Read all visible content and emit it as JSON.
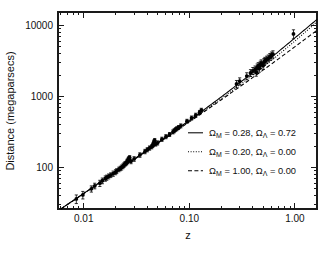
{
  "figure": {
    "background_color": "#ffffff",
    "ink_color": "#000000"
  },
  "axes": {
    "x_title": "z",
    "y_title": "Distance (megaparsecs)",
    "x_ticklabels": [
      "0.01",
      "0.10",
      "1.00"
    ],
    "y_ticklabels": [
      "100",
      "1000",
      "10000"
    ]
  },
  "legend": {
    "entries": [
      {
        "style": "solid",
        "text": "Ω_M = 0.28, Ω_Λ = 0.72",
        "om": "0.28",
        "ol": "0.72"
      },
      {
        "style": "dotted",
        "text": "Ω_M = 0.20, Ω_Λ = 0.00",
        "om": "0.20",
        "ol": "0.00"
      },
      {
        "style": "dashed",
        "text": "Ω_M = 1.00, Ω_Λ = 0.00",
        "om": "1.00",
        "ol": "0.00"
      }
    ],
    "omega_symbol": "Ω",
    "sub_m": "M",
    "sub_lambda": "Λ",
    "eq": " = ",
    "comma": ", "
  },
  "chart_data": {
    "type": "scatter",
    "title": "",
    "xlabel": "z",
    "ylabel": "Distance (megaparsecs)",
    "xscale": "log",
    "yscale": "log",
    "xlim": [
      0.0057,
      1.62
    ],
    "ylim": [
      26,
      15500
    ],
    "xticks": [
      0.01,
      0.1,
      1.0
    ],
    "yticks": [
      100,
      1000,
      10000
    ],
    "grid": false,
    "legend_position": "center-right",
    "marker": "filled-circle-with-vertical-errorbars",
    "points": [
      {
        "z": 0.0085,
        "d": 36,
        "err": 5
      },
      {
        "z": 0.0098,
        "d": 41,
        "err": 5
      },
      {
        "z": 0.0118,
        "d": 50,
        "err": 5
      },
      {
        "z": 0.0127,
        "d": 55,
        "err": 5
      },
      {
        "z": 0.0142,
        "d": 60,
        "err": 6
      },
      {
        "z": 0.015,
        "d": 65,
        "err": 6
      },
      {
        "z": 0.016,
        "d": 70,
        "err": 6
      },
      {
        "z": 0.0165,
        "d": 72,
        "err": 6
      },
      {
        "z": 0.0172,
        "d": 75,
        "err": 6
      },
      {
        "z": 0.018,
        "d": 78,
        "err": 6
      },
      {
        "z": 0.019,
        "d": 82,
        "err": 7
      },
      {
        "z": 0.02,
        "d": 86,
        "err": 7
      },
      {
        "z": 0.0205,
        "d": 89,
        "err": 7
      },
      {
        "z": 0.0215,
        "d": 94,
        "err": 7
      },
      {
        "z": 0.0222,
        "d": 97,
        "err": 7
      },
      {
        "z": 0.0228,
        "d": 100,
        "err": 8
      },
      {
        "z": 0.0235,
        "d": 104,
        "err": 8
      },
      {
        "z": 0.024,
        "d": 108,
        "err": 8
      },
      {
        "z": 0.0245,
        "d": 112,
        "err": 8
      },
      {
        "z": 0.025,
        "d": 114,
        "err": 8
      },
      {
        "z": 0.0255,
        "d": 118,
        "err": 9
      },
      {
        "z": 0.0258,
        "d": 122,
        "err": 9
      },
      {
        "z": 0.0262,
        "d": 126,
        "err": 9
      },
      {
        "z": 0.0265,
        "d": 130,
        "err": 9
      },
      {
        "z": 0.0268,
        "d": 134,
        "err": 9
      },
      {
        "z": 0.0272,
        "d": 138,
        "err": 9
      },
      {
        "z": 0.028,
        "d": 122,
        "err": 9
      },
      {
        "z": 0.03,
        "d": 132,
        "err": 10
      },
      {
        "z": 0.034,
        "d": 150,
        "err": 11
      },
      {
        "z": 0.038,
        "d": 168,
        "err": 12
      },
      {
        "z": 0.04,
        "d": 178,
        "err": 12
      },
      {
        "z": 0.042,
        "d": 188,
        "err": 13
      },
      {
        "z": 0.044,
        "d": 196,
        "err": 13
      },
      {
        "z": 0.045,
        "d": 205,
        "err": 14
      },
      {
        "z": 0.0455,
        "d": 212,
        "err": 14
      },
      {
        "z": 0.046,
        "d": 222,
        "err": 15
      },
      {
        "z": 0.0465,
        "d": 232,
        "err": 15
      },
      {
        "z": 0.047,
        "d": 240,
        "err": 16
      },
      {
        "z": 0.048,
        "d": 214,
        "err": 14
      },
      {
        "z": 0.05,
        "d": 222,
        "err": 15
      },
      {
        "z": 0.055,
        "d": 250,
        "err": 17
      },
      {
        "z": 0.06,
        "d": 272,
        "err": 18
      },
      {
        "z": 0.065,
        "d": 292,
        "err": 19
      },
      {
        "z": 0.07,
        "d": 318,
        "err": 21
      },
      {
        "z": 0.072,
        "d": 330,
        "err": 22
      },
      {
        "z": 0.074,
        "d": 342,
        "err": 22
      },
      {
        "z": 0.076,
        "d": 352,
        "err": 23
      },
      {
        "z": 0.079,
        "d": 366,
        "err": 24
      },
      {
        "z": 0.083,
        "d": 386,
        "err": 25
      },
      {
        "z": 0.095,
        "d": 448,
        "err": 29
      },
      {
        "z": 0.105,
        "d": 498,
        "err": 33
      },
      {
        "z": 0.115,
        "d": 545,
        "err": 36
      },
      {
        "z": 0.125,
        "d": 596,
        "err": 40
      },
      {
        "z": 0.13,
        "d": 640,
        "err": 42
      },
      {
        "z": 0.28,
        "d": 1500,
        "err": 180
      },
      {
        "z": 0.3,
        "d": 1640,
        "err": 190
      },
      {
        "z": 0.35,
        "d": 1940,
        "err": 220
      },
      {
        "z": 0.38,
        "d": 2150,
        "err": 240
      },
      {
        "z": 0.4,
        "d": 2300,
        "err": 260
      },
      {
        "z": 0.42,
        "d": 2420,
        "err": 270
      },
      {
        "z": 0.43,
        "d": 2180,
        "err": 250
      },
      {
        "z": 0.44,
        "d": 2580,
        "err": 290
      },
      {
        "z": 0.45,
        "d": 2700,
        "err": 300
      },
      {
        "z": 0.46,
        "d": 2480,
        "err": 280
      },
      {
        "z": 0.47,
        "d": 2820,
        "err": 320
      },
      {
        "z": 0.48,
        "d": 2950,
        "err": 330
      },
      {
        "z": 0.5,
        "d": 2720,
        "err": 310
      },
      {
        "z": 0.51,
        "d": 3080,
        "err": 350
      },
      {
        "z": 0.52,
        "d": 3200,
        "err": 360
      },
      {
        "z": 0.54,
        "d": 3320,
        "err": 380
      },
      {
        "z": 0.56,
        "d": 3450,
        "err": 390
      },
      {
        "z": 0.58,
        "d": 3620,
        "err": 410
      },
      {
        "z": 0.6,
        "d": 3800,
        "err": 430
      },
      {
        "z": 0.62,
        "d": 3950,
        "err": 450
      },
      {
        "z": 0.97,
        "d": 7600,
        "err": 1100
      }
    ],
    "series": [
      {
        "name": "Ω_M = 0.28, Ω_Λ = 0.72",
        "style": "solid",
        "om": 0.28,
        "ol": 0.72,
        "description": "Flat Lambda-CDM concordance model"
      },
      {
        "name": "Ω_M = 0.20, Ω_Λ = 0.00",
        "style": "dotted",
        "om": 0.2,
        "ol": 0.0,
        "description": "Open, matter-only model"
      },
      {
        "name": "Ω_M = 1.00, Ω_Λ = 0.00",
        "style": "dashed",
        "om": 1.0,
        "ol": 0.0,
        "description": "Einstein-de Sitter model"
      }
    ]
  }
}
